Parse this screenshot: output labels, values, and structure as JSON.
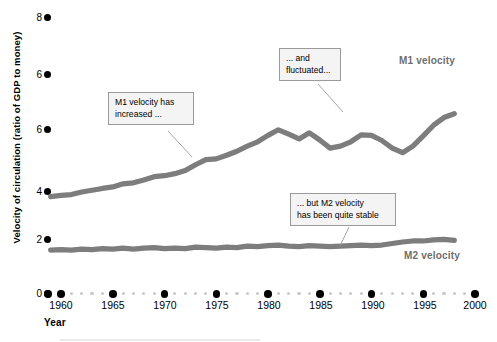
{
  "chart_data": {
    "type": "line",
    "title": "",
    "xlabel": "Year",
    "ylabel": "Velocity of circulation (ratio of GDP to money)",
    "xlim": [
      1959,
      2000
    ],
    "ylim": [
      0,
      8.6
    ],
    "grid": false,
    "legend_position": "inline-right",
    "x_ticks": [
      "1960",
      "1965",
      "1970",
      "1975",
      "1980",
      "1985",
      "1990",
      "1995",
      "2000"
    ],
    "y_ticks": [
      "8",
      "6",
      "6",
      "4",
      "2",
      "0"
    ],
    "y_tick_values": [
      8,
      7,
      6,
      4,
      2,
      0
    ],
    "series": [
      {
        "name": "M1 velocity",
        "color": "#7d7d7d",
        "x": [
          1959,
          1960,
          1961,
          1962,
          1963,
          1964,
          1965,
          1966,
          1967,
          1968,
          1969,
          1970,
          1971,
          1972,
          1973,
          1974,
          1975,
          1976,
          1977,
          1978,
          1979,
          1980,
          1981,
          1982,
          1983,
          1984,
          1985,
          1986,
          1987,
          1988,
          1989,
          1990,
          1991,
          1992,
          1993,
          1994,
          1995,
          1996,
          1997,
          1998
        ],
        "values": [
          3.8,
          3.85,
          3.88,
          3.98,
          4.05,
          4.12,
          4.18,
          4.3,
          4.34,
          4.45,
          4.58,
          4.62,
          4.7,
          4.82,
          5.05,
          5.25,
          5.28,
          5.42,
          5.58,
          5.78,
          5.95,
          6.2,
          6.42,
          6.25,
          6.06,
          6.3,
          6.02,
          5.7,
          5.78,
          5.95,
          6.22,
          6.2,
          6.0,
          5.7,
          5.52,
          5.78,
          6.18,
          6.6,
          6.9,
          7.05
        ]
      },
      {
        "name": "M2 velocity",
        "color": "#7d7d7d",
        "x": [
          1959,
          1960,
          1961,
          1962,
          1963,
          1964,
          1965,
          1966,
          1967,
          1968,
          1969,
          1970,
          1971,
          1972,
          1973,
          1974,
          1975,
          1976,
          1977,
          1978,
          1979,
          1980,
          1981,
          1982,
          1983,
          1984,
          1985,
          1986,
          1987,
          1988,
          1989,
          1990,
          1991,
          1992,
          1993,
          1994,
          1995,
          1996,
          1997,
          1998
        ],
        "values": [
          1.7,
          1.72,
          1.7,
          1.74,
          1.72,
          1.76,
          1.74,
          1.78,
          1.74,
          1.78,
          1.8,
          1.76,
          1.78,
          1.76,
          1.82,
          1.8,
          1.78,
          1.82,
          1.8,
          1.86,
          1.84,
          1.88,
          1.9,
          1.86,
          1.84,
          1.88,
          1.86,
          1.84,
          1.86,
          1.88,
          1.9,
          1.88,
          1.9,
          1.96,
          2.02,
          2.06,
          2.06,
          2.1,
          2.12,
          2.08
        ]
      }
    ],
    "annotations": [
      {
        "id": "m1-increased",
        "text": "M1 velocity has\nincreased ..."
      },
      {
        "id": "m1-fluctuated",
        "text": "... and\nfluctuated..."
      },
      {
        "id": "m2-stable",
        "text": "... but M2 velocity\nhas been quite stable"
      }
    ]
  },
  "axes": {
    "x_axis_name": "Year",
    "y_axis_name": "Velocity of circulation (ratio of GDP to money)"
  },
  "series_labels": {
    "m1": "M1 velocity",
    "m2": "M2 velocity"
  },
  "callouts": {
    "m1_increased": "M1 velocity has\nincreased ...",
    "m1_fluctuated": "... and\nfluctuated...",
    "m2_stable": "... but M2 velocity\nhas been quite stable"
  },
  "colors": {
    "series_line": "#7d7d7d",
    "tick_dot": "#000000",
    "minor_dot": "#c9c9c9",
    "callout_bg": "#f4f4f4",
    "callout_border": "#9a9a9a"
  }
}
